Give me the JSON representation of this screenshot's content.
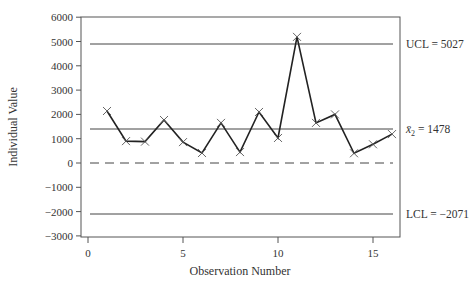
{
  "chart_data": {
    "type": "line",
    "title": "",
    "xlabel": "Observation Number",
    "ylabel": "Individual Value",
    "xlim": [
      -1.5,
      16.8
    ],
    "ylim": [
      -3000,
      6000
    ],
    "x_ticks": [
      0,
      5,
      10,
      15
    ],
    "y_ticks": [
      6000,
      5000,
      4000,
      3000,
      2000,
      1000,
      0,
      -1000,
      -2000,
      -3000
    ],
    "y_tick_labels": [
      "6000",
      "5000",
      "4000",
      "3000",
      "2000",
      "1000",
      "0",
      "−1000",
      "−2000",
      "−3000"
    ],
    "grid": false,
    "x": [
      1,
      2,
      3,
      4,
      5,
      6,
      7,
      8,
      9,
      10,
      11,
      12,
      13,
      14,
      15,
      16
    ],
    "series": [
      {
        "name": "Individual Value",
        "marker": "x",
        "values": [
          2140,
          900,
          880,
          1770,
          860,
          410,
          1650,
          450,
          2100,
          1030,
          5190,
          1650,
          2000,
          400,
          770,
          1190
        ]
      }
    ],
    "reference_lines": [
      {
        "name": "UCL",
        "value": 5027,
        "style": "solid",
        "label": "UCL = 5027"
      },
      {
        "name": "center",
        "value": 1478,
        "style": "solid",
        "label_symbol": "x̄₂",
        "label_value": "= 1478"
      },
      {
        "name": "zero",
        "value": 0,
        "style": "dashed"
      },
      {
        "name": "LCL",
        "value": -2071,
        "style": "solid",
        "label": "LCL = −2071"
      }
    ],
    "colors": {
      "line": "#222222",
      "axis": "#555555",
      "reference": "#444444",
      "text": "#333333"
    }
  }
}
